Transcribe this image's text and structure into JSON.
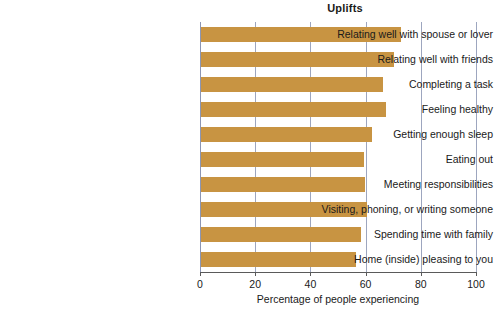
{
  "chart_data": {
    "type": "bar",
    "orientation": "horizontal",
    "title": "Uplifts",
    "xlabel": "Percentage of people experiencing",
    "ylabel": "",
    "xlim": [
      0,
      100
    ],
    "xticks": [
      0,
      20,
      40,
      60,
      80,
      100
    ],
    "xtick_labels": [
      "0",
      "20",
      "40",
      "60",
      "80",
      "100"
    ],
    "grid": "vertical",
    "legend": null,
    "bar_color": "#c89442",
    "gridline_color": "#8c96b4",
    "axis_color": "#5a5a5a",
    "categories": [
      "Relating well with spouse or lover",
      "Relating well with friends",
      "Completing a task",
      "Feeling healthy",
      "Getting enough sleep",
      "Eating out",
      "Meeting responsibilities",
      "Visiting, phoning, or writing someone",
      "Spending time with family",
      "Home (inside) pleasing to you"
    ],
    "values": [
      72.5,
      70,
      66,
      67,
      62,
      59,
      59.5,
      60,
      58,
      56
    ]
  }
}
